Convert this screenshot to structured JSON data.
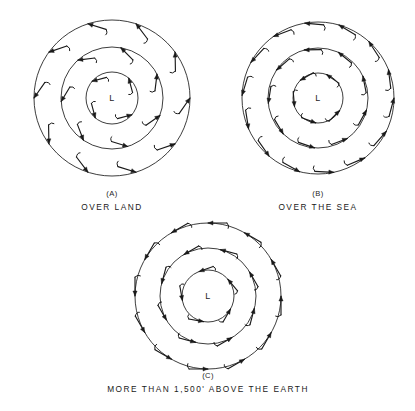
{
  "page": {
    "clipped_header_text": "WIND CIRCULATION AROUND A LOW PRESSURE AREA",
    "background_color": "#ffffff",
    "ink_color": "#1a1a1a",
    "width": 415,
    "height": 411
  },
  "panels": [
    {
      "id": "panel-a",
      "letter": "(A)",
      "caption": "OVER LAND",
      "center_label": "L",
      "center_label_meaning": "low-pressure-center",
      "cx": 112,
      "cy": 98,
      "radii": [
        78,
        51,
        26
      ],
      "isobar_count": 3,
      "inflow_cross_angle_degrees": 35,
      "rotation_sense": "counterclockwise",
      "arrow_style": "barbed-tail-straight-shaft-solid-head",
      "arrows": [
        {
          "ring": 0,
          "angle_deg": 0
        },
        {
          "ring": 0,
          "angle_deg": 36
        },
        {
          "ring": 0,
          "angle_deg": 72
        },
        {
          "ring": 0,
          "angle_deg": 108
        },
        {
          "ring": 0,
          "angle_deg": 144
        },
        {
          "ring": 0,
          "angle_deg": 180
        },
        {
          "ring": 0,
          "angle_deg": 216
        },
        {
          "ring": 0,
          "angle_deg": 252
        },
        {
          "ring": 0,
          "angle_deg": 288
        },
        {
          "ring": 0,
          "angle_deg": 324
        },
        {
          "ring": 1,
          "angle_deg": 20
        },
        {
          "ring": 1,
          "angle_deg": 72
        },
        {
          "ring": 1,
          "angle_deg": 124
        },
        {
          "ring": 1,
          "angle_deg": 176
        },
        {
          "ring": 1,
          "angle_deg": 228
        },
        {
          "ring": 1,
          "angle_deg": 280
        },
        {
          "ring": 1,
          "angle_deg": 332
        },
        {
          "ring": 2,
          "angle_deg": 40
        },
        {
          "ring": 2,
          "angle_deg": 130
        },
        {
          "ring": 2,
          "angle_deg": 220
        },
        {
          "ring": 2,
          "angle_deg": 310
        }
      ]
    },
    {
      "id": "panel-b",
      "letter": "(B)",
      "caption": "OVER THE SEA",
      "center_label": "L",
      "center_label_meaning": "low-pressure-center",
      "cx": 318,
      "cy": 98,
      "radii": [
        76,
        50,
        25
      ],
      "isobar_count": 3,
      "inflow_cross_angle_degrees": 15,
      "rotation_sense": "counterclockwise",
      "arrow_style": "barbed-tail-straight-shaft-solid-head",
      "arrows": [
        {
          "ring": 0,
          "angle_deg": 0
        },
        {
          "ring": 0,
          "angle_deg": 26
        },
        {
          "ring": 0,
          "angle_deg": 52
        },
        {
          "ring": 0,
          "angle_deg": 78
        },
        {
          "ring": 0,
          "angle_deg": 104
        },
        {
          "ring": 0,
          "angle_deg": 130
        },
        {
          "ring": 0,
          "angle_deg": 156
        },
        {
          "ring": 0,
          "angle_deg": 182
        },
        {
          "ring": 0,
          "angle_deg": 208
        },
        {
          "ring": 0,
          "angle_deg": 234
        },
        {
          "ring": 0,
          "angle_deg": 260
        },
        {
          "ring": 0,
          "angle_deg": 286
        },
        {
          "ring": 0,
          "angle_deg": 312
        },
        {
          "ring": 0,
          "angle_deg": 338
        },
        {
          "ring": 1,
          "angle_deg": 14
        },
        {
          "ring": 1,
          "angle_deg": 54
        },
        {
          "ring": 1,
          "angle_deg": 94
        },
        {
          "ring": 1,
          "angle_deg": 134
        },
        {
          "ring": 1,
          "angle_deg": 174
        },
        {
          "ring": 1,
          "angle_deg": 214
        },
        {
          "ring": 1,
          "angle_deg": 254
        },
        {
          "ring": 1,
          "angle_deg": 294
        },
        {
          "ring": 1,
          "angle_deg": 334
        },
        {
          "ring": 2,
          "angle_deg": 30
        },
        {
          "ring": 2,
          "angle_deg": 95
        },
        {
          "ring": 2,
          "angle_deg": 160
        },
        {
          "ring": 2,
          "angle_deg": 225
        },
        {
          "ring": 2,
          "angle_deg": 290
        }
      ]
    },
    {
      "id": "panel-c",
      "letter": "(C)",
      "caption": "MORE THAN 1,500' ABOVE THE EARTH",
      "center_label": "L",
      "center_label_meaning": "low-pressure-center",
      "cx": 208,
      "cy": 296,
      "radii": [
        73,
        48,
        26
      ],
      "isobar_count": 3,
      "inflow_cross_angle_degrees": 0,
      "rotation_sense": "counterclockwise",
      "arrow_style": "barbed-tail-straight-shaft-solid-head",
      "arrows": [
        {
          "ring": 0,
          "angle_deg": 0
        },
        {
          "ring": 0,
          "angle_deg": 30
        },
        {
          "ring": 0,
          "angle_deg": 60
        },
        {
          "ring": 0,
          "angle_deg": 90
        },
        {
          "ring": 0,
          "angle_deg": 120
        },
        {
          "ring": 0,
          "angle_deg": 150
        },
        {
          "ring": 0,
          "angle_deg": 180
        },
        {
          "ring": 0,
          "angle_deg": 210
        },
        {
          "ring": 0,
          "angle_deg": 240
        },
        {
          "ring": 0,
          "angle_deg": 270
        },
        {
          "ring": 0,
          "angle_deg": 300
        },
        {
          "ring": 0,
          "angle_deg": 330
        },
        {
          "ring": 1,
          "angle_deg": 15
        },
        {
          "ring": 1,
          "angle_deg": 60
        },
        {
          "ring": 1,
          "angle_deg": 105
        },
        {
          "ring": 1,
          "angle_deg": 150
        },
        {
          "ring": 1,
          "angle_deg": 195
        },
        {
          "ring": 1,
          "angle_deg": 240
        },
        {
          "ring": 1,
          "angle_deg": 285
        },
        {
          "ring": 1,
          "angle_deg": 330
        },
        {
          "ring": 2,
          "angle_deg": 30
        },
        {
          "ring": 2,
          "angle_deg": 100
        },
        {
          "ring": 2,
          "angle_deg": 170
        },
        {
          "ring": 2,
          "angle_deg": 250
        },
        {
          "ring": 2,
          "angle_deg": 320
        }
      ]
    }
  ],
  "captions": {
    "a_letter": "(A)",
    "a_text": "OVER LAND",
    "b_letter": "(B)",
    "b_text": "OVER THE SEA",
    "c_letter": "(C)",
    "c_text": "MORE THAN 1,500' ABOVE THE EARTH"
  }
}
